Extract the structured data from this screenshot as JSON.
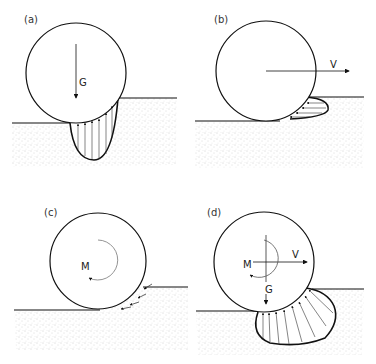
{
  "figure": {
    "panels": [
      {
        "id": "a",
        "label": "(a)",
        "forces": [
          "G"
        ],
        "description": "Wheel sinking under vertical load G; vertical pressure distribution beneath the wheel"
      },
      {
        "id": "b",
        "label": "(b)",
        "forces": [
          "V"
        ],
        "description": "Wheel pushed horizontally with velocity V; horizontal pressure bulb in front"
      },
      {
        "id": "c",
        "label": "(c)",
        "forces": [
          "M"
        ],
        "description": "Wheel under driving moment M; tangential shear arrows at contact"
      },
      {
        "id": "d",
        "label": "(d)",
        "forces": [
          "M",
          "V",
          "G"
        ],
        "description": "Combined moment M, velocity V and load G; radial pressure distribution"
      }
    ],
    "symbols": {
      "G": "G",
      "V": "V",
      "M": "M"
    },
    "colors": {
      "line": "#111111",
      "stipple": "#9a9a9a",
      "background": "#ffffff"
    }
  }
}
